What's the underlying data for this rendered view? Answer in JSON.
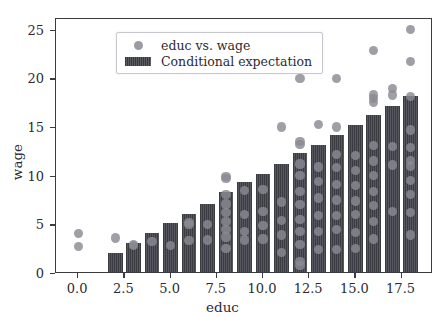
{
  "chart_data": {
    "type": "bar",
    "title": "",
    "xlabel": "educ",
    "ylabel": "wage",
    "xlim": [
      -1.2,
      19.2
    ],
    "ylim": [
      0,
      26.2
    ],
    "xticks": [
      0.0,
      2.5,
      5.0,
      7.5,
      10.0,
      12.5,
      15.0,
      17.5
    ],
    "xticklabels": [
      "0.0",
      "2.5",
      "5.0",
      "7.5",
      "10.0",
      "12.5",
      "15.0",
      "17.5"
    ],
    "yticks": [
      0,
      5,
      10,
      15,
      20,
      25
    ],
    "yticklabels": [
      "0",
      "5",
      "10",
      "15",
      "20",
      "25"
    ],
    "grid": false,
    "legend_position": "upper left",
    "series": [
      {
        "name": "educ vs. wage",
        "type": "scatter",
        "color": "#8a8a92",
        "points": [
          [
            0,
            4.2
          ],
          [
            0,
            2.85
          ],
          [
            2,
            3.7
          ],
          [
            3,
            3.05
          ],
          [
            3,
            2.95
          ],
          [
            4,
            3.35
          ],
          [
            5,
            2.9
          ],
          [
            6,
            5.25
          ],
          [
            6,
            5.05
          ],
          [
            6,
            3.4
          ],
          [
            7,
            5.1
          ],
          [
            7,
            3.5
          ],
          [
            8,
            10.0
          ],
          [
            8,
            9.8
          ],
          [
            8,
            8.2
          ],
          [
            8,
            7.2
          ],
          [
            8,
            6.3
          ],
          [
            8,
            5.4
          ],
          [
            8,
            4.6
          ],
          [
            8,
            3.8
          ],
          [
            8,
            2.6
          ],
          [
            9,
            8.6
          ],
          [
            9,
            6.1
          ],
          [
            9,
            4.4
          ],
          [
            9,
            3.5
          ],
          [
            10,
            8.7
          ],
          [
            10,
            6.4
          ],
          [
            10,
            5.0
          ],
          [
            10,
            3.6
          ],
          [
            11,
            15.1
          ],
          [
            11,
            7.4
          ],
          [
            11,
            5.5
          ],
          [
            11,
            4.0
          ],
          [
            11,
            2.2
          ],
          [
            12,
            22.2
          ],
          [
            12,
            21.8
          ],
          [
            12,
            20.1
          ],
          [
            12,
            13.6
          ],
          [
            12,
            13.3
          ],
          [
            12,
            11.3
          ],
          [
            12,
            10.1
          ],
          [
            12,
            8.5
          ],
          [
            12,
            7.1
          ],
          [
            12,
            5.6
          ],
          [
            12,
            4.4
          ],
          [
            12,
            3.0
          ],
          [
            12,
            1.3
          ],
          [
            12,
            0.9
          ],
          [
            13,
            15.4
          ],
          [
            13,
            11.0
          ],
          [
            13,
            9.5
          ],
          [
            13,
            7.8
          ],
          [
            13,
            6.0
          ],
          [
            13,
            4.4
          ],
          [
            13,
            2.5
          ],
          [
            14,
            20.1
          ],
          [
            14,
            15.1
          ],
          [
            14,
            12.3
          ],
          [
            14,
            10.9
          ],
          [
            14,
            9.2
          ],
          [
            14,
            7.6
          ],
          [
            14,
            6.0
          ],
          [
            14,
            4.6
          ],
          [
            14,
            2.5
          ],
          [
            15,
            12.2
          ],
          [
            15,
            10.6
          ],
          [
            15,
            9.1
          ],
          [
            15,
            7.5
          ],
          [
            15,
            6.1
          ],
          [
            15,
            4.3
          ],
          [
            15,
            2.6
          ],
          [
            16,
            23.0
          ],
          [
            16,
            18.4
          ],
          [
            16,
            18.0
          ],
          [
            16,
            17.6
          ],
          [
            16,
            13.2
          ],
          [
            16,
            11.6
          ],
          [
            16,
            10.1
          ],
          [
            16,
            8.5
          ],
          [
            16,
            7.0
          ],
          [
            16,
            5.4
          ],
          [
            16,
            3.6
          ],
          [
            17,
            19.1
          ],
          [
            17,
            18.4
          ],
          [
            17,
            13.1
          ],
          [
            17,
            11.2
          ],
          [
            17,
            6.4
          ],
          [
            18,
            25.1
          ],
          [
            18,
            21.8
          ],
          [
            18,
            18.2
          ],
          [
            18,
            14.8
          ],
          [
            18,
            13.0
          ],
          [
            18,
            11.7
          ],
          [
            18,
            11.1
          ],
          [
            18,
            9.6
          ],
          [
            18,
            8.2
          ],
          [
            18,
            6.3
          ],
          [
            18,
            4.0
          ]
        ]
      },
      {
        "name": "Conditional expectation",
        "type": "bar",
        "color": "#4a4a52",
        "categories": [
          2,
          3,
          4,
          5,
          6,
          7,
          8,
          9,
          10,
          11,
          12,
          13,
          14,
          15,
          16,
          17,
          18
        ],
        "values": [
          2.0,
          3.0,
          4.0,
          5.0,
          6.0,
          7.0,
          8.2,
          9.2,
          10.1,
          11.1,
          12.2,
          13.1,
          14.1,
          15.1,
          16.1,
          17.1,
          18.1
        ]
      }
    ]
  },
  "legend": {
    "entries": [
      {
        "label": "educ vs. wage",
        "key": "scatter-marker"
      },
      {
        "label": "Conditional expectation",
        "key": "bar-swatch"
      }
    ]
  },
  "axes": {
    "xlabel": "educ",
    "ylabel": "wage"
  }
}
